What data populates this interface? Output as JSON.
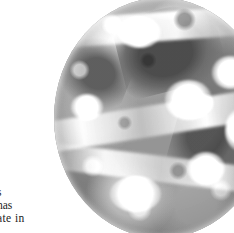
{
  "page": {
    "background_color": "#ffffff",
    "width": 234,
    "height": 233
  },
  "figure": {
    "name": "satellite-globe",
    "kind": "grayscale-satellite-image",
    "clipped_edges": "top",
    "palette": {
      "ocean_mid": "#8d8d8d",
      "land_dark": "#3d3d3d",
      "cloud_bright": "#ffffff",
      "limb_shadow": "#000000"
    }
  },
  "body_text": {
    "fragment_lines": [
      "s",
      "has",
      "ate  in"
    ],
    "note": "left-clipped column of running text beside the figure",
    "color": "#1b1b1b"
  }
}
